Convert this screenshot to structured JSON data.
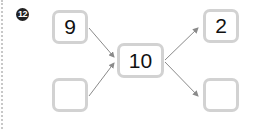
{
  "problem": {
    "number_label": "12",
    "left": {
      "top_value": "9",
      "bottom_value": ""
    },
    "center_value": "10",
    "right": {
      "top_value": "2",
      "bottom_value": ""
    }
  },
  "colors": {
    "box_border": "#d2d2d2",
    "arrow": "#888888",
    "badge_bg": "#222222"
  }
}
